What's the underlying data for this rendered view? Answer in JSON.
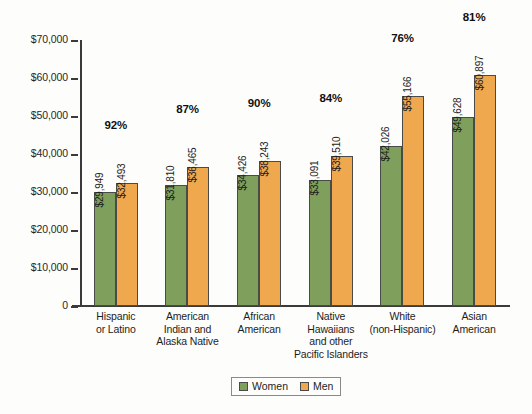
{
  "chart_data": {
    "type": "bar",
    "title": "",
    "xlabel": "",
    "ylabel": "",
    "ylim": [
      0,
      70000
    ],
    "grid": false,
    "legend_position": "bottom-center",
    "ytick_labels": [
      "$70,000",
      "$60,000",
      "$50,000",
      "$40,000",
      "$30,000",
      "$20,000",
      "$10,000",
      "0"
    ],
    "ytick_values": [
      70000,
      60000,
      50000,
      40000,
      30000,
      20000,
      10000,
      0
    ],
    "categories": [
      "Hispanic or Latino",
      "American Indian and Alaska Native",
      "African American",
      "Native Hawaiians and other Pacific Islanders",
      "White (non-Hispanic)",
      "Asian American"
    ],
    "category_lines": [
      [
        "Hispanic",
        "or Latino"
      ],
      [
        "American",
        "Indian and",
        "Alaska Native"
      ],
      [
        "African",
        "American"
      ],
      [
        "Native",
        "Hawaiians",
        "and other",
        "Pacific Islanders"
      ],
      [
        "White",
        "(non-Hispanic)"
      ],
      [
        "Asian",
        "American"
      ]
    ],
    "series": [
      {
        "name": "Women",
        "color": "#7fa05c",
        "values": [
          29949,
          31810,
          34426,
          33091,
          42026,
          49628
        ],
        "labels": [
          "$29,949",
          "$31,810",
          "$34,426",
          "$33,091",
          "$42,026",
          "$49,628"
        ]
      },
      {
        "name": "Men",
        "color": "#f0a84e",
        "values": [
          32493,
          36465,
          38243,
          39510,
          55166,
          60897
        ],
        "labels": [
          "$32,493",
          "$36,465",
          "$38,243",
          "$39,510",
          "$55,166",
          "$60,897"
        ]
      }
    ],
    "annotations": {
      "name": "ratio-percent",
      "values": [
        "92%",
        "87%",
        "90%",
        "84%",
        "76%",
        "81%"
      ]
    }
  },
  "legend": {
    "items": [
      {
        "label": "Women",
        "color": "#7fa05c"
      },
      {
        "label": "Men",
        "color": "#f0a84e"
      }
    ]
  }
}
